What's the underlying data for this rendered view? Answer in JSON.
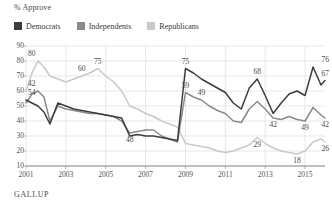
{
  "header": {
    "axis_title": "% Approve",
    "source": "GALLUP"
  },
  "legend": {
    "position": "top-left",
    "items": [
      {
        "label": "Democrats",
        "color": "#3d3d3d"
      },
      {
        "label": "Independents",
        "color": "#8a8a8a"
      },
      {
        "label": "Republicans",
        "color": "#c9c9c9"
      }
    ]
  },
  "chart_data": {
    "type": "line",
    "title": "% Approve",
    "xlabel": "",
    "ylabel": "% Approve",
    "ylim": [
      10,
      90
    ],
    "yticks": [
      90,
      80,
      70,
      60,
      50,
      40,
      30,
      20,
      10
    ],
    "xlim": [
      2001,
      2016
    ],
    "xticks": [
      "2001",
      "2003",
      "2005",
      "2007",
      "2009",
      "2011",
      "2013",
      "2015"
    ],
    "grid": true,
    "legend_position": "top-left",
    "x": [
      2001.0,
      2001.3,
      2001.6,
      2001.9,
      2002.2,
      2002.6,
      2003.0,
      2003.4,
      2003.8,
      2004.2,
      2004.6,
      2005.0,
      2005.4,
      2005.8,
      2006.2,
      2006.6,
      2007.0,
      2007.4,
      2007.8,
      2008.2,
      2008.6,
      2009.0,
      2009.4,
      2009.8,
      2010.2,
      2010.6,
      2011.0,
      2011.4,
      2011.8,
      2012.2,
      2012.6,
      2013.0,
      2013.4,
      2013.8,
      2014.2,
      2014.6,
      2015.0,
      2015.4,
      2015.8,
      2016.0
    ],
    "series": [
      {
        "name": "Democrats",
        "color": "#3d3d3d",
        "values": [
          54,
          52,
          50,
          46,
          38,
          52,
          50,
          48,
          47,
          46,
          45,
          44,
          43,
          42,
          30,
          31,
          30,
          30,
          29,
          28,
          27,
          75,
          72,
          68,
          65,
          62,
          59,
          52,
          48,
          62,
          68,
          57,
          45,
          52,
          58,
          60,
          57,
          76,
          64,
          67
        ],
        "labels": [
          {
            "x": 2001.0,
            "value": 54
          },
          {
            "x": 2009.0,
            "value": 75
          },
          {
            "x": 2012.6,
            "value": 68
          },
          {
            "x": 2015.4,
            "value": 76
          },
          {
            "x": 2016.0,
            "value": 67
          }
        ]
      },
      {
        "name": "Independents",
        "color": "#8a8a8a",
        "values": [
          52,
          58,
          60,
          56,
          40,
          50,
          48,
          47,
          46,
          45,
          45,
          44,
          43,
          40,
          32,
          33,
          34,
          34,
          30,
          28,
          26,
          59,
          56,
          54,
          50,
          47,
          45,
          40,
          39,
          48,
          53,
          48,
          42,
          41,
          43,
          41,
          40,
          49,
          44,
          42
        ],
        "labels": [
          {
            "x": 2006.3,
            "value": 48
          },
          {
            "x": 2009.0,
            "value": 59
          },
          {
            "x": 2009.9,
            "value": 49
          },
          {
            "x": 2013.3,
            "value": 42
          },
          {
            "x": 2015.1,
            "value": 49
          },
          {
            "x": 2016.0,
            "value": 42
          }
        ]
      },
      {
        "name": "Republicans",
        "color": "#c9c9c9",
        "values": [
          60,
          72,
          80,
          76,
          70,
          68,
          66,
          68,
          70,
          72,
          75,
          70,
          66,
          60,
          50,
          48,
          45,
          43,
          40,
          38,
          36,
          25,
          24,
          23,
          22,
          20,
          19,
          20,
          22,
          24,
          29,
          25,
          22,
          20,
          19,
          18,
          20,
          26,
          28,
          26
        ],
        "labels": [
          {
            "x": 2001.6,
            "value": 80
          },
          {
            "x": 2001.1,
            "value": 42
          },
          {
            "x": 2004.7,
            "value": 75
          },
          {
            "x": 2004.0,
            "value": 60
          },
          {
            "x": 2012.7,
            "value": 29
          },
          {
            "x": 2014.7,
            "value": 18
          },
          {
            "x": 2016.0,
            "value": 26
          }
        ]
      }
    ]
  }
}
